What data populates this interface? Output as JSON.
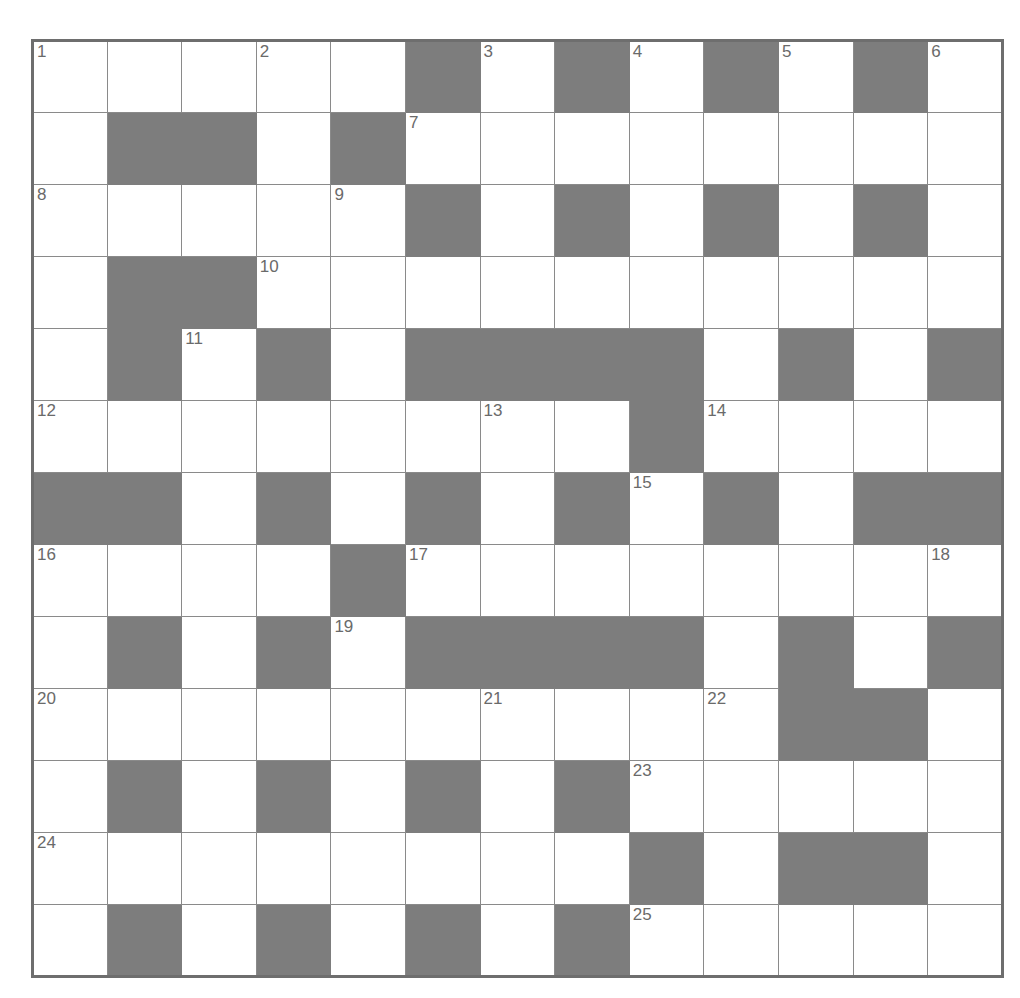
{
  "puzzle": {
    "kind": "crossword-grid",
    "rows": 13,
    "cols": 13,
    "colors": {
      "block": "#7d7d7d",
      "cell": "#ffffff",
      "gridline": "#8a8a8a",
      "border": "#6e6e6e",
      "number_text": "#6a6a6a"
    },
    "legend": {
      "0": "open cell (white)",
      "1": "blocked cell (grey)"
    },
    "grid": [
      [
        0,
        0,
        0,
        0,
        0,
        1,
        0,
        1,
        0,
        1,
        0,
        1,
        0
      ],
      [
        0,
        1,
        1,
        0,
        1,
        0,
        0,
        0,
        0,
        0,
        0,
        0,
        0
      ],
      [
        0,
        0,
        0,
        0,
        0,
        1,
        0,
        1,
        0,
        1,
        0,
        1,
        0
      ],
      [
        0,
        1,
        1,
        0,
        0,
        0,
        0,
        0,
        0,
        0,
        0,
        0,
        0
      ],
      [
        0,
        1,
        0,
        1,
        0,
        1,
        1,
        1,
        1,
        0,
        1,
        0,
        1
      ],
      [
        0,
        0,
        0,
        0,
        0,
        0,
        0,
        0,
        1,
        0,
        0,
        0,
        0
      ],
      [
        1,
        1,
        0,
        1,
        0,
        1,
        0,
        1,
        0,
        1,
        0,
        1,
        1
      ],
      [
        0,
        0,
        0,
        0,
        1,
        0,
        0,
        0,
        0,
        0,
        0,
        0,
        0
      ],
      [
        0,
        1,
        0,
        1,
        0,
        1,
        1,
        1,
        1,
        0,
        1,
        0,
        1
      ],
      [
        0,
        0,
        0,
        0,
        0,
        0,
        0,
        0,
        0,
        0,
        1,
        1,
        0
      ],
      [
        0,
        1,
        0,
        1,
        0,
        1,
        0,
        1,
        0,
        0,
        0,
        0,
        0
      ],
      [
        0,
        0,
        0,
        0,
        0,
        0,
        0,
        0,
        1,
        0,
        1,
        1,
        0
      ],
      [
        0,
        1,
        0,
        1,
        0,
        1,
        0,
        1,
        0,
        0,
        0,
        0,
        0
      ]
    ],
    "numbers": [
      {
        "n": 1,
        "row": 1,
        "col": 1
      },
      {
        "n": 2,
        "row": 1,
        "col": 4
      },
      {
        "n": 3,
        "row": 1,
        "col": 7
      },
      {
        "n": 4,
        "row": 1,
        "col": 9
      },
      {
        "n": 5,
        "row": 1,
        "col": 11
      },
      {
        "n": 6,
        "row": 1,
        "col": 13
      },
      {
        "n": 7,
        "row": 2,
        "col": 6
      },
      {
        "n": 8,
        "row": 3,
        "col": 1
      },
      {
        "n": 9,
        "row": 3,
        "col": 5
      },
      {
        "n": 10,
        "row": 4,
        "col": 4
      },
      {
        "n": 11,
        "row": 5,
        "col": 3
      },
      {
        "n": 12,
        "row": 6,
        "col": 1
      },
      {
        "n": 13,
        "row": 6,
        "col": 7
      },
      {
        "n": 14,
        "row": 6,
        "col": 10
      },
      {
        "n": 15,
        "row": 7,
        "col": 9
      },
      {
        "n": 16,
        "row": 8,
        "col": 1
      },
      {
        "n": 17,
        "row": 8,
        "col": 6
      },
      {
        "n": 18,
        "row": 8,
        "col": 13
      },
      {
        "n": 19,
        "row": 9,
        "col": 5
      },
      {
        "n": 20,
        "row": 10,
        "col": 1
      },
      {
        "n": 21,
        "row": 10,
        "col": 7
      },
      {
        "n": 22,
        "row": 10,
        "col": 10
      },
      {
        "n": 23,
        "row": 11,
        "col": 9
      },
      {
        "n": 24,
        "row": 12,
        "col": 1
      },
      {
        "n": 25,
        "row": 13,
        "col": 9
      }
    ],
    "letters": []
  }
}
